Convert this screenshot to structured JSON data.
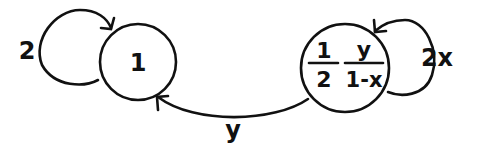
{
  "nodes": [
    {
      "id": "n1",
      "label": "1"
    },
    {
      "id": "n2",
      "label_parts": {
        "frac1_num": "1",
        "frac1_den": "2",
        "frac2_num": "y",
        "frac2_den": "1-x"
      }
    }
  ],
  "edges": [
    {
      "from": "n1",
      "to": "n1",
      "label": "2"
    },
    {
      "from": "n2",
      "to": "n2",
      "label": "2x"
    },
    {
      "from": "n2",
      "to": "n1",
      "label": "y"
    }
  ],
  "colors": {
    "stroke": "#111111",
    "background": "#ffffff"
  }
}
